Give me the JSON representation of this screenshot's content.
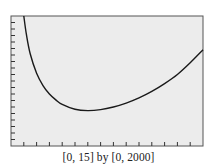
{
  "chart_data": {
    "type": "line",
    "title": "",
    "caption": "[0, 15] by [0, 2000]",
    "xlabel": "",
    "ylabel": "",
    "xlim": [
      0,
      15
    ],
    "ylim": [
      0,
      2000
    ],
    "x_tick_step": 1,
    "y_tick_step": 100,
    "grid": false,
    "legend": "none",
    "plot_background": "#ececec",
    "line_color": "#1a1a1a",
    "series": [
      {
        "name": "f(x)",
        "x": [
          1.0,
          1.2,
          1.5,
          2.0,
          2.5,
          3.0,
          3.5,
          4.0,
          5.0,
          6.0,
          7.0,
          8.0,
          9.0,
          10.0,
          11.0,
          12.0,
          13.0,
          14.0,
          15.0
        ],
        "values": [
          2000,
          1720,
          1420,
          1120,
          930,
          800,
          710,
          640,
          565,
          545,
          560,
          600,
          660,
          740,
          840,
          960,
          1100,
          1280,
          1480
        ]
      }
    ]
  },
  "caption": "[0, 15] by [0, 2000]"
}
